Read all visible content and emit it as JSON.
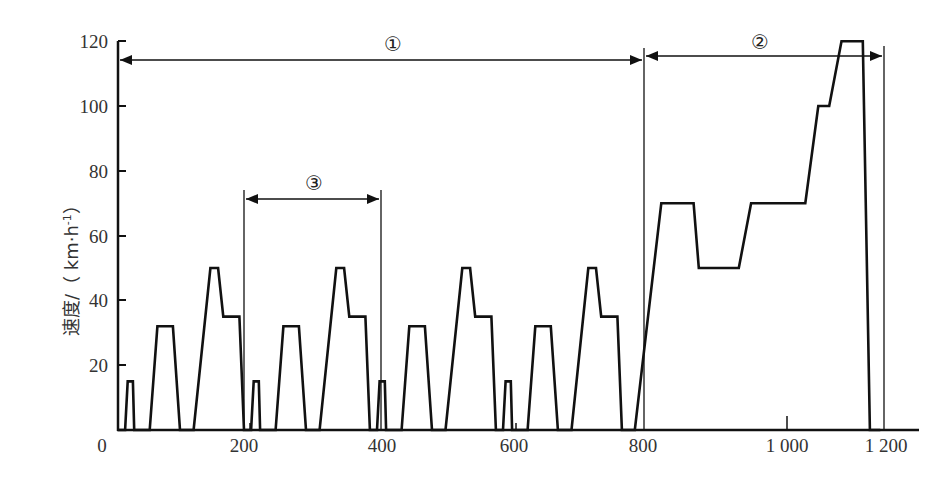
{
  "chart_data": {
    "type": "line",
    "title": "",
    "xlabel": "",
    "ylabel": "速度/（km·h⁻¹）",
    "xlim": [
      0,
      1200
    ],
    "ylim": [
      0,
      120
    ],
    "x_ticks": [
      0,
      200,
      400,
      600,
      800,
      1000,
      1200
    ],
    "x_tick_labels": [
      "0",
      "200",
      "400",
      "600",
      "800",
      "1 000",
      "1 200"
    ],
    "y_ticks": [
      0,
      20,
      40,
      60,
      80,
      100,
      120
    ],
    "y_tick_labels": [
      "0",
      "20",
      "40",
      "60",
      "80",
      "100",
      "120"
    ],
    "grid": false,
    "series": [
      {
        "name": "speed",
        "x": [
          0,
          11,
          15,
          23,
          25,
          28,
          49,
          61,
          85,
          96,
          112,
          117,
          143,
          155,
          163,
          176,
          178,
          188,
          195,
          206,
          210,
          218,
          220,
          223,
          244,
          256,
          280,
          291,
          307,
          312,
          338,
          350,
          358,
          371,
          373,
          383,
          390,
          401,
          405,
          413,
          415,
          418,
          439,
          451,
          475,
          486,
          502,
          507,
          533,
          545,
          553,
          566,
          568,
          578,
          585,
          596,
          600,
          608,
          610,
          613,
          634,
          646,
          670,
          681,
          697,
          702,
          728,
          740,
          748,
          761,
          763,
          773,
          780,
          800,
          841,
          891,
          899,
          911,
          961,
          980,
          1044,
          1064,
          1084,
          1101,
          1120,
          1153,
          1164,
          1180
        ],
        "y": [
          0,
          0,
          15,
          15,
          0,
          0,
          0,
          32,
          32,
          0,
          0,
          0,
          50,
          50,
          35,
          35,
          35,
          35,
          0,
          0,
          15,
          15,
          0,
          0,
          0,
          32,
          32,
          0,
          0,
          0,
          50,
          50,
          35,
          35,
          35,
          35,
          0,
          0,
          15,
          15,
          0,
          0,
          0,
          32,
          32,
          0,
          0,
          0,
          50,
          50,
          35,
          35,
          35,
          35,
          0,
          0,
          15,
          15,
          0,
          0,
          0,
          32,
          32,
          0,
          0,
          0,
          50,
          50,
          35,
          35,
          35,
          35,
          0,
          0,
          70,
          70,
          50,
          50,
          50,
          70,
          70,
          70,
          100,
          100,
          120,
          120,
          0,
          0
        ]
      }
    ],
    "annotations": [
      {
        "label": "①",
        "from_x": 0,
        "to_x": 800,
        "y": 114
      },
      {
        "label": "②",
        "from_x": 800,
        "to_x": 1180,
        "y": 114
      },
      {
        "label": "③",
        "from_x": 195,
        "to_x": 390,
        "y": 71
      }
    ]
  },
  "labels": {
    "ylabel": "速度/（ km·h",
    "ylabel_sup": "-1",
    "ylabel_close": "）",
    "ann1": "①",
    "ann2": "②",
    "ann3": "③",
    "x0": "0",
    "x200": "200",
    "x400": "400",
    "x600": "600",
    "x800": "800",
    "x1000": "1 000",
    "x1200": "1 200",
    "y20": "20",
    "y40": "40",
    "y60": "60",
    "y80": "80",
    "y100": "100",
    "y120": "120"
  }
}
